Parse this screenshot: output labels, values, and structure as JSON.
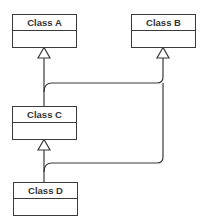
{
  "diagram": {
    "type": "UML class diagram",
    "classes": [
      {
        "id": "A",
        "name": "Class A"
      },
      {
        "id": "B",
        "name": "Class B"
      },
      {
        "id": "C",
        "name": "Class C"
      },
      {
        "id": "D",
        "name": "Class D"
      }
    ],
    "relationships": [
      {
        "from": "C",
        "to": "A",
        "type": "generalization"
      },
      {
        "from": "C",
        "to": "B",
        "type": "generalization"
      },
      {
        "from": "D",
        "to": "C",
        "type": "generalization"
      },
      {
        "from": "D",
        "to": "B",
        "type": "generalization"
      }
    ],
    "colors": {
      "line": "#3a3a3a",
      "background": "#ffffff"
    }
  }
}
